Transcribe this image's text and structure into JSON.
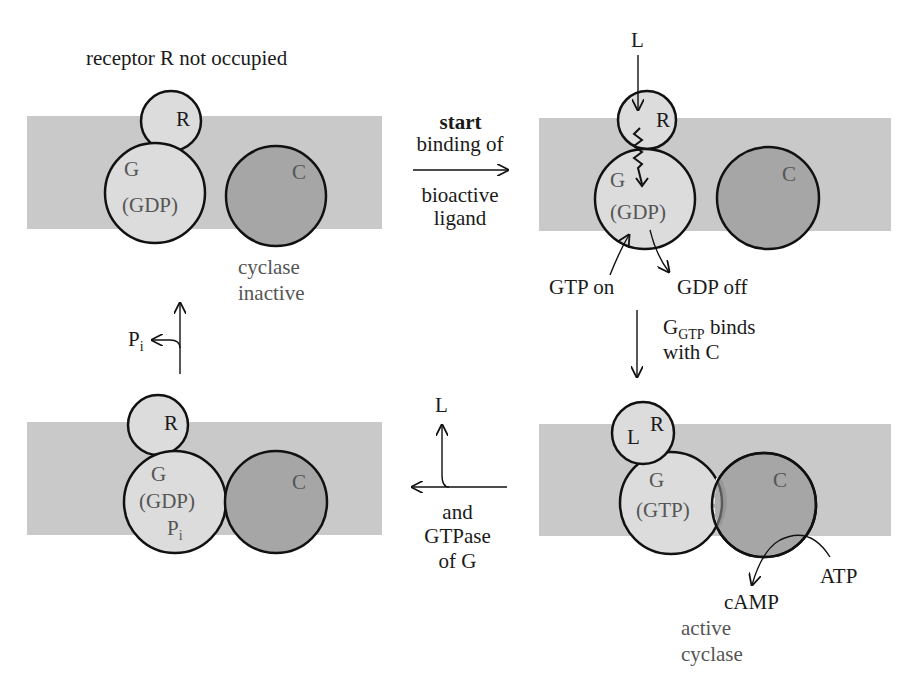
{
  "colors": {
    "membrane": "#c9c9c9",
    "protein_light": "#dcdcdc",
    "cyclase": "#a6a6a6",
    "outline": "#111111"
  },
  "panels": {
    "top_left": {
      "title": "receptor R not occupied",
      "R": "R",
      "G": "G",
      "G_state": "(GDP)",
      "C": "C",
      "caption_1": "cyclase",
      "caption_2": "inactive"
    },
    "top_right": {
      "ligand": "L",
      "R": "R",
      "G": "G",
      "G_state": "(GDP)",
      "C": "C",
      "gtp_on": "GTP on",
      "gdp_off": "GDP off"
    },
    "bottom_right": {
      "L": "L",
      "R": "R",
      "G": "G",
      "G_state": "(GTP)",
      "C": "C",
      "atp": "ATP",
      "camp": "cAMP",
      "caption_1": "active",
      "caption_2": "cyclase"
    },
    "bottom_left": {
      "R": "R",
      "G": "G",
      "G_state": "(GDP)",
      "Pi_main": "P",
      "Pi_sub": "i",
      "C": "C"
    }
  },
  "transitions": {
    "start": {
      "bold": "start",
      "line1": "binding of",
      "line2": "bioactive",
      "line3": "ligand"
    },
    "g_binds": {
      "main": "G",
      "sub": "GTP",
      "rest": " binds",
      "line2": "with C"
    },
    "release": {
      "ligand": "L",
      "line1": "and",
      "line2": "GTPase",
      "line3": "of G"
    },
    "pi_release": {
      "main": "P",
      "sub": "i"
    }
  }
}
